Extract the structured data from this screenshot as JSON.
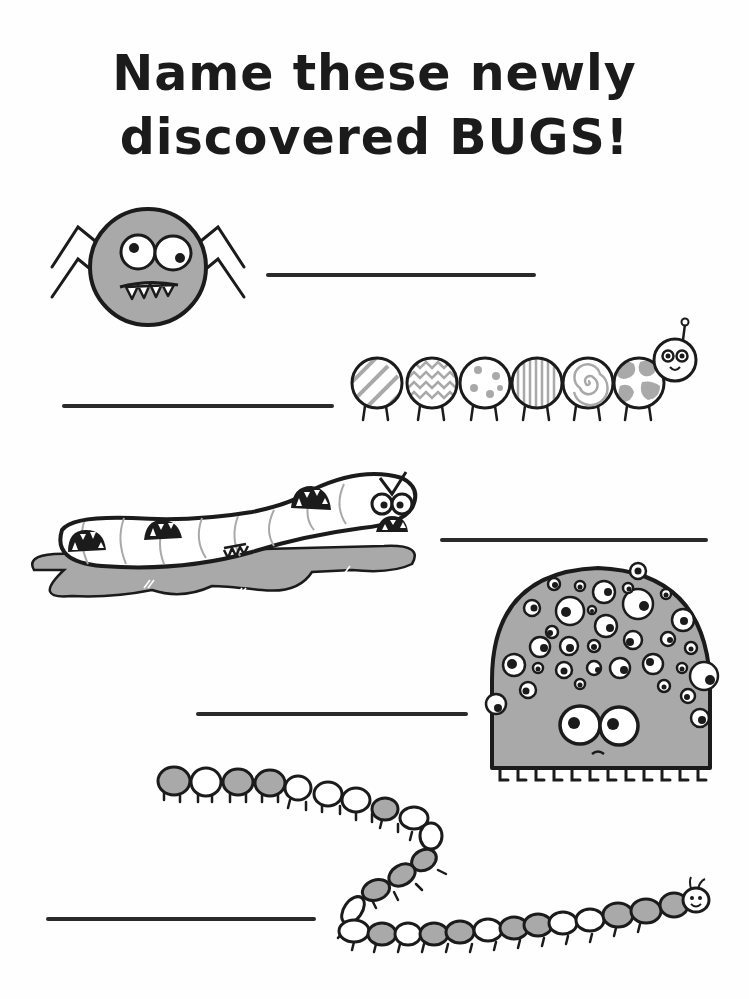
{
  "worksheet": {
    "title_line_1": "Name these newly",
    "title_line_2": "discovered BUGS!",
    "colors": {
      "ink": "#1b1b1b",
      "bug_fill_gray": "#a9a9a9",
      "paper": "#fefefe"
    },
    "bugs": [
      {
        "id": "spider",
        "icon": "spider-bug-icon",
        "description": "round gray spider with googly eyes and fangs"
      },
      {
        "id": "patterned-caterpillar",
        "icon": "caterpillar-icon",
        "description": "caterpillar with six patterned segments: stripes, zigzag, dots, vertical lines, spiral, spots"
      },
      {
        "id": "worm",
        "icon": "worm-icon",
        "description": "angry worm with many mouths lying in a puddle"
      },
      {
        "id": "many-eyed-blob",
        "icon": "blob-monster-icon",
        "description": "dome-shaped gray bug covered in eyes with many small legs"
      },
      {
        "id": "centipede",
        "icon": "centipede-icon",
        "description": "long winding centipede with alternating gray and white segments"
      }
    ],
    "answers": [
      {
        "value": "",
        "placeholder": ""
      },
      {
        "value": "",
        "placeholder": ""
      },
      {
        "value": "",
        "placeholder": ""
      },
      {
        "value": "",
        "placeholder": ""
      },
      {
        "value": "",
        "placeholder": ""
      }
    ]
  }
}
